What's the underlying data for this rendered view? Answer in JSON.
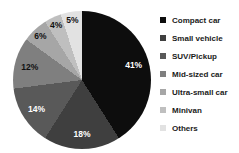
{
  "chart_data": {
    "type": "pie",
    "title": "",
    "legend_position": "right",
    "start_angle_deg": 0,
    "direction": "clockwise",
    "slices": [
      {
        "label": "Compact car",
        "value": 41,
        "pct_label": "41%",
        "color": "#0d0d0d",
        "label_color": "#ffffff"
      },
      {
        "label": "Small vehicle",
        "value": 18,
        "pct_label": "18%",
        "color": "#3f3f3f",
        "label_color": "#ffffff"
      },
      {
        "label": "SUV/Pickup",
        "value": 14,
        "pct_label": "14%",
        "color": "#595959",
        "label_color": "#ffffff"
      },
      {
        "label": "Mid-sized car",
        "value": 12,
        "pct_label": "12%",
        "color": "#7f7f7f",
        "label_color": "#111111"
      },
      {
        "label": "Ultra-small car",
        "value": 6,
        "pct_label": "6%",
        "color": "#a6a6a6",
        "label_color": "#111111"
      },
      {
        "label": "Minivan",
        "value": 4,
        "pct_label": "4%",
        "color": "#bfbfbf",
        "label_color": "#111111"
      },
      {
        "label": "Others",
        "value": 5,
        "pct_label": "5%",
        "color": "#e2e2e2",
        "label_color": "#111111"
      }
    ]
  }
}
